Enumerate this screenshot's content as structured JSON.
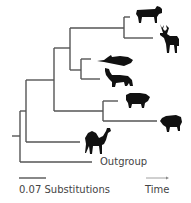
{
  "diagram": {
    "type": "phylogenetic-tree",
    "line_color": "#555555",
    "silhouette_color": "#111111",
    "taxa": [
      {
        "name": "cow",
        "icon": "cow-icon"
      },
      {
        "name": "deer",
        "icon": "deer-icon"
      },
      {
        "name": "whale",
        "icon": "whale-icon"
      },
      {
        "name": "hippopotamus",
        "icon": "hippo-icon"
      },
      {
        "name": "pig",
        "icon": "pig-icon"
      },
      {
        "name": "peccary",
        "icon": "peccary-icon"
      },
      {
        "name": "camel",
        "icon": "camel-icon"
      }
    ],
    "outgroup_label": "Outgroup",
    "scale_bar_label": "0.07 Substitutions",
    "time_label": "Time"
  }
}
